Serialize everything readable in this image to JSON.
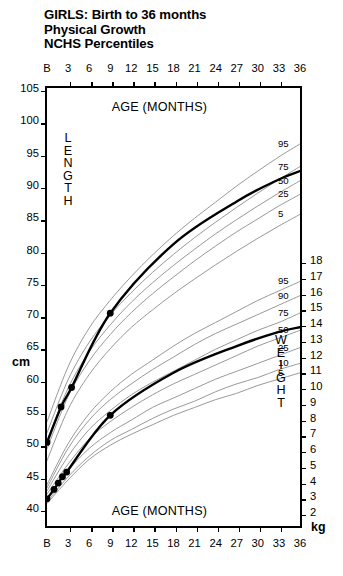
{
  "title": {
    "line1": "GIRLS: Birth to 36 months",
    "line2": "Physical Growth",
    "line3": "NCHS Percentiles"
  },
  "labels": {
    "age_top": "AGE (MONTHS)",
    "age_bottom": "AGE (MONTHS)",
    "length_vertical": "LENGTH",
    "weight_vertical": "WEIGHT",
    "unit_length": "cm",
    "unit_weight": "kg"
  },
  "axes": {
    "x_ticks": [
      "B",
      "3",
      "6",
      "9",
      "12",
      "15",
      "18",
      "21",
      "24",
      "27",
      "30",
      "33",
      "36"
    ],
    "x_values": [
      0,
      3,
      6,
      9,
      12,
      15,
      18,
      21,
      24,
      27,
      30,
      33,
      36
    ],
    "left_ticks": [
      "105",
      "100",
      "95",
      "90",
      "85",
      "80",
      "75",
      "70",
      "65",
      "60",
      "55",
      "50",
      "45",
      "40"
    ],
    "left_values": [
      105,
      100,
      95,
      90,
      85,
      80,
      75,
      70,
      65,
      60,
      55,
      50,
      45,
      40
    ],
    "right_ticks": [
      "18",
      "17",
      "16",
      "15",
      "14",
      "13",
      "12",
      "11",
      "10",
      "9",
      "8",
      "7",
      "6",
      "5",
      "4",
      "3",
      "2"
    ],
    "right_values": [
      18,
      17,
      16,
      15,
      14,
      13,
      12,
      11,
      10,
      9,
      8,
      7,
      6,
      5,
      4,
      3,
      2
    ]
  },
  "chart_data": {
    "type": "line",
    "title": "GIRLS: Birth to 36 months Physical Growth NCHS Percentiles",
    "xlabel": "AGE (MONTHS)",
    "ylabel": "LENGTH (cm) / WEIGHT (kg)",
    "xlim": [
      0,
      36
    ],
    "ylim_length_cm": [
      40,
      105
    ],
    "ylim_weight_kg": [
      1.5,
      19.0
    ],
    "grid": false,
    "legend": "inline-right-edge-percentile-labels",
    "x": [
      0,
      3,
      6,
      9,
      12,
      15,
      18,
      21,
      24,
      27,
      30,
      33,
      36
    ],
    "length_percentiles": [
      {
        "name": "95",
        "values": [
          53.5,
          62.0,
          68.0,
          72.3,
          76.0,
          79.3,
          82.3,
          85.0,
          87.5,
          90.0,
          92.3,
          94.5,
          96.5
        ]
      },
      {
        "name": "75",
        "values": [
          51.8,
          60.0,
          65.8,
          70.0,
          73.5,
          76.6,
          79.4,
          82.0,
          84.4,
          86.7,
          88.9,
          91.0,
          93.0
        ]
      },
      {
        "name": "50",
        "values": [
          50.5,
          58.7,
          64.3,
          68.5,
          72.0,
          75.0,
          77.7,
          80.2,
          82.6,
          84.8,
          86.9,
          88.9,
          90.8
        ]
      },
      {
        "name": "25",
        "values": [
          49.3,
          57.4,
          62.9,
          67.0,
          70.4,
          73.3,
          75.9,
          78.4,
          80.7,
          82.9,
          84.9,
          86.9,
          88.7
        ]
      },
      {
        "name": "5",
        "values": [
          47.5,
          55.4,
          60.8,
          64.8,
          68.1,
          70.8,
          73.3,
          75.6,
          77.8,
          79.9,
          81.9,
          83.8,
          85.6
        ]
      }
    ],
    "weight_percentiles": [
      {
        "name": "95",
        "values": [
          3.8,
          6.4,
          8.3,
          9.7,
          10.8,
          11.7,
          12.6,
          13.4,
          14.1,
          14.8,
          15.5,
          16.1,
          16.7
        ]
      },
      {
        "name": "90",
        "values": [
          3.6,
          6.1,
          7.9,
          9.2,
          10.2,
          11.1,
          11.9,
          12.7,
          13.4,
          14.0,
          14.6,
          15.2,
          15.8
        ]
      },
      {
        "name": "75",
        "values": [
          3.4,
          5.6,
          7.3,
          8.5,
          9.5,
          10.3,
          11.0,
          11.7,
          12.4,
          13.0,
          13.6,
          14.1,
          14.7
        ]
      },
      {
        "name": "50",
        "values": [
          3.2,
          5.1,
          6.7,
          7.8,
          8.7,
          9.5,
          10.2,
          10.8,
          11.4,
          12.0,
          12.6,
          13.1,
          13.6
        ]
      },
      {
        "name": "25",
        "values": [
          2.9,
          4.7,
          6.1,
          7.1,
          7.9,
          8.7,
          9.3,
          9.9,
          10.5,
          11.0,
          11.5,
          12.0,
          12.5
        ]
      },
      {
        "name": "10",
        "values": [
          2.7,
          4.3,
          5.6,
          6.6,
          7.3,
          8.0,
          8.6,
          9.1,
          9.7,
          10.2,
          10.6,
          11.1,
          11.5
        ]
      },
      {
        "name": "5",
        "values": [
          2.6,
          4.1,
          5.4,
          6.3,
          7.0,
          7.6,
          8.2,
          8.7,
          9.2,
          9.6,
          10.1,
          10.5,
          10.9
        ]
      }
    ],
    "patient_length_curve": {
      "name": "patient length",
      "points": [
        {
          "x": 0,
          "y": 50.3
        },
        {
          "x": 2,
          "y": 55.8
        },
        {
          "x": 3.5,
          "y": 58.8
        },
        {
          "x": 9,
          "y": 70.3
        },
        {
          "x": 18,
          "y": 81.0
        },
        {
          "x": 27,
          "y": 87.6
        },
        {
          "x": 33,
          "y": 91.0
        },
        {
          "x": 36,
          "y": 92.3
        }
      ],
      "plotted_markers": [
        {
          "x": 0,
          "y": 50.3
        },
        {
          "x": 2,
          "y": 55.8
        },
        {
          "x": 3.5,
          "y": 58.8
        },
        {
          "x": 9,
          "y": 70.3
        }
      ]
    },
    "patient_weight_curve": {
      "name": "patient weight",
      "points": [
        {
          "x": 0,
          "y": 2.9
        },
        {
          "x": 1,
          "y": 3.5
        },
        {
          "x": 1.6,
          "y": 3.9
        },
        {
          "x": 2.2,
          "y": 4.3
        },
        {
          "x": 2.8,
          "y": 4.6
        },
        {
          "x": 9,
          "y": 8.2
        },
        {
          "x": 18,
          "y": 10.9
        },
        {
          "x": 27,
          "y": 12.6
        },
        {
          "x": 33,
          "y": 13.5
        },
        {
          "x": 36,
          "y": 13.8
        }
      ],
      "plotted_markers": [
        {
          "x": 0,
          "y": 2.9
        },
        {
          "x": 1,
          "y": 3.5
        },
        {
          "x": 1.6,
          "y": 3.9
        },
        {
          "x": 2.2,
          "y": 4.3
        },
        {
          "x": 2.8,
          "y": 4.6
        },
        {
          "x": 9,
          "y": 8.2
        }
      ]
    },
    "length_percentile_labels": [
      "95",
      "75",
      "50",
      "25",
      "5"
    ],
    "weight_percentile_labels": [
      "95",
      "90",
      "75",
      "50",
      "25",
      "10",
      "5"
    ]
  },
  "colors": {
    "axis": "#000000",
    "percentile_curve": "#8c8c8c",
    "patient_curve": "#000000",
    "marker": "#000000",
    "background": "#ffffff"
  }
}
